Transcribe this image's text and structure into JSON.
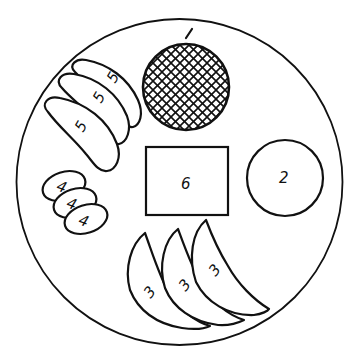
{
  "diagram": {
    "type": "plate-layout",
    "colors": {
      "ink": "#111111",
      "background": "#ffffff"
    },
    "plate": {
      "shape": "circle",
      "label": ""
    },
    "items": [
      {
        "id": "item-1",
        "label": "1",
        "shape": "crosshatched-circle",
        "count": 1,
        "position": "top-center"
      },
      {
        "id": "item-2",
        "label": "2",
        "shape": "circle",
        "count": 1,
        "position": "right"
      },
      {
        "id": "item-3",
        "label": "3",
        "shape": "crescent-wedge",
        "count": 3,
        "position": "bottom"
      },
      {
        "id": "item-4",
        "label": "4",
        "shape": "small-oval",
        "count": 3,
        "position": "left"
      },
      {
        "id": "item-5",
        "label": "5",
        "shape": "curved-elongated-oval",
        "count": 3,
        "position": "upper-left"
      },
      {
        "id": "item-6",
        "label": "6",
        "shape": "rectangle",
        "count": 1,
        "position": "center"
      }
    ],
    "labels": {
      "l1": "1",
      "l2": "2",
      "l3a": "3",
      "l3b": "3",
      "l3c": "3",
      "l4a": "4",
      "l4b": "4",
      "l4c": "4",
      "l5a": "5",
      "l5b": "5",
      "l5c": "5",
      "l6": "6"
    }
  }
}
